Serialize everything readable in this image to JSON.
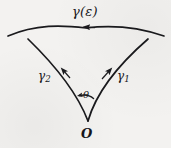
{
  "figure": {
    "background_color": "#f3f2f0",
    "ink_color": "#1a1a1d",
    "labels": {
      "top_arc": "γ(ε)",
      "right_curve_base": "γ",
      "right_curve_sub": "1",
      "left_curve_base": "γ",
      "left_curve_sub": "2",
      "angle": "θ",
      "vertex": "O"
    },
    "geometry": {
      "vertex_point": "O",
      "vertex_x": 88,
      "vertex_y": 120,
      "angle_symbol": "θ",
      "arrow_directions": {
        "top_arc": "leftward",
        "left_curve": "up-left",
        "right_curve": "up-right",
        "angle_arc": "counterclockwise"
      }
    }
  }
}
